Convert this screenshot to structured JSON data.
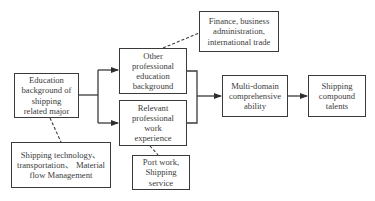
{
  "diagram": {
    "type": "flowchart",
    "nodes": {
      "education_background": {
        "lines": [
          "Education",
          "background of",
          "shipping",
          "related major"
        ]
      },
      "other_professional_education": {
        "lines": [
          "Other",
          "professional",
          "education",
          "background"
        ]
      },
      "relevant_work_experience": {
        "lines": [
          "Relevant",
          "professional",
          "work",
          "experience"
        ]
      },
      "finance_note": {
        "lines": [
          "Finance, business",
          "administration,",
          "international trade"
        ]
      },
      "multi_domain_ability": {
        "lines": [
          "Multi-domain",
          "comprehensive",
          "ability"
        ]
      },
      "shipping_compound_talents": {
        "lines": [
          "Shipping",
          "compound",
          "talents"
        ]
      },
      "shipping_technology_note": {
        "lines": [
          "Shipping technology、",
          "transportation、 Material",
          "flow Management"
        ]
      },
      "port_work_note": {
        "lines": [
          "Port work,",
          "Shipping",
          "service"
        ]
      }
    },
    "edges": [
      {
        "from": "education_background",
        "to": "other_professional_education",
        "style": "solid-arrow"
      },
      {
        "from": "education_background",
        "to": "relevant_work_experience",
        "style": "solid-arrow"
      },
      {
        "from": "other_professional_education",
        "to": "multi_domain_ability",
        "style": "solid-arrow"
      },
      {
        "from": "relevant_work_experience",
        "to": "multi_domain_ability",
        "style": "solid-arrow"
      },
      {
        "from": "multi_domain_ability",
        "to": "shipping_compound_talents",
        "style": "solid-arrow"
      },
      {
        "from": "other_professional_education",
        "to": "finance_note",
        "style": "dashed"
      },
      {
        "from": "education_background",
        "to": "shipping_technology_note",
        "style": "dashed"
      },
      {
        "from": "relevant_work_experience",
        "to": "port_work_note",
        "style": "dashed"
      }
    ],
    "colors": {
      "line": "#3a3a3a",
      "text": "#3c3c3c",
      "background": "#ffffff"
    }
  }
}
